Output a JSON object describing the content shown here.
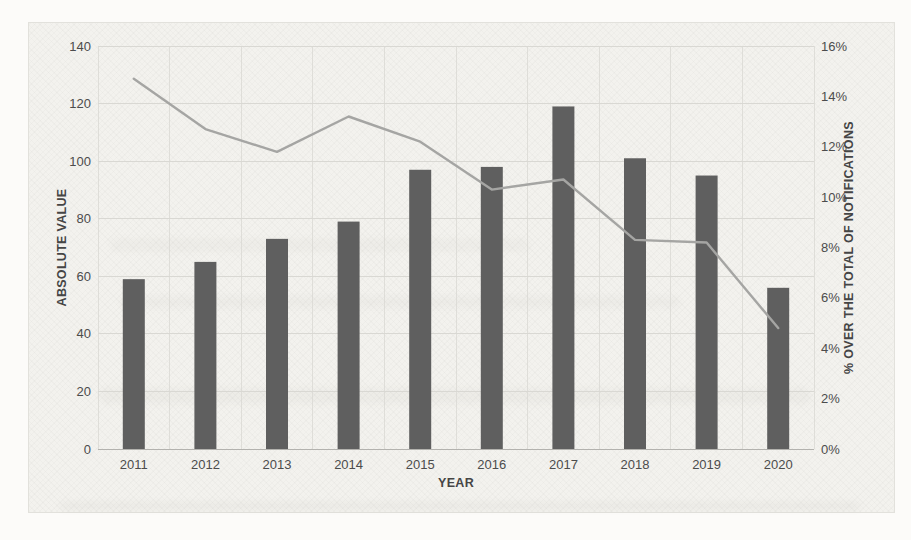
{
  "chart_data": {
    "type": "combo-bar-line",
    "categories": [
      "2011",
      "2012",
      "2013",
      "2014",
      "2015",
      "2016",
      "2017",
      "2018",
      "2019",
      "2020"
    ],
    "series": [
      {
        "name": "ABSOLUTE VALUE",
        "type": "bar",
        "axis": "left",
        "values": [
          59,
          65,
          73,
          79,
          97,
          98,
          119,
          101,
          95,
          56
        ],
        "color": "#5f5f5f"
      },
      {
        "name": "% OVER THE TOTAL OF NOTIFICATIONS",
        "type": "line",
        "axis": "right",
        "values": [
          14.7,
          12.7,
          11.8,
          13.2,
          12.2,
          10.3,
          10.7,
          8.3,
          8.2,
          4.8
        ],
        "color": "#a5a5a3"
      }
    ],
    "title": "",
    "xlabel": "YEAR",
    "ylabel_left": "ABSOLUTE VALUE",
    "ylabel_right": "% OVER THE TOTAL OF NOTIFICATIONS",
    "left_axis": {
      "min": 0,
      "max": 140,
      "step": 20
    },
    "right_axis": {
      "min": 0,
      "max": 16,
      "step": 2,
      "suffix": "%"
    },
    "grid": true,
    "grid_color": "#d9d8d3",
    "axis_line_color": "#b3b2ae",
    "legend": "none"
  }
}
